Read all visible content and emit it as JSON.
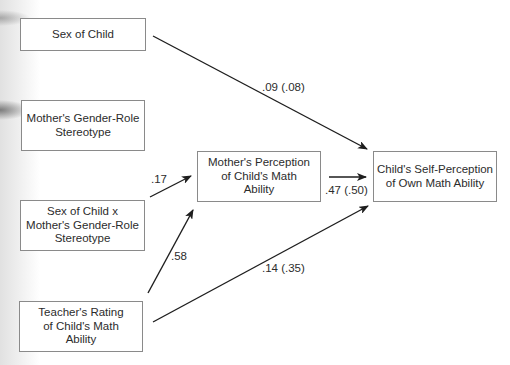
{
  "diagram": {
    "type": "path-model",
    "nodes": [
      {
        "id": "sex_of_child",
        "label": "Sex of Child"
      },
      {
        "id": "mother_stereotype",
        "label": "Mother's Gender-Role\nStereotype"
      },
      {
        "id": "interaction",
        "label": "Sex of Child x\nMother's Gender-Role\nStereotype"
      },
      {
        "id": "teacher_rating",
        "label": "Teacher's Rating\nof Child's Math\nAbility"
      },
      {
        "id": "mother_perception",
        "label": "Mother's Perception\nof Child's Math\nAbility"
      },
      {
        "id": "child_self_perception",
        "label": "Child's Self-Perception\nof Own Math Ability"
      }
    ],
    "edges": [
      {
        "from": "sex_of_child",
        "to": "child_self_perception",
        "label": ".09 (.08)"
      },
      {
        "from": "interaction",
        "to": "mother_perception",
        "label": ".17"
      },
      {
        "from": "teacher_rating",
        "to": "mother_perception",
        "label": ".58"
      },
      {
        "from": "mother_perception",
        "to": "child_self_perception",
        "label": ".47 (.50)"
      },
      {
        "from": "teacher_rating",
        "to": "child_self_perception",
        "label": ".14 (.35)"
      }
    ]
  }
}
